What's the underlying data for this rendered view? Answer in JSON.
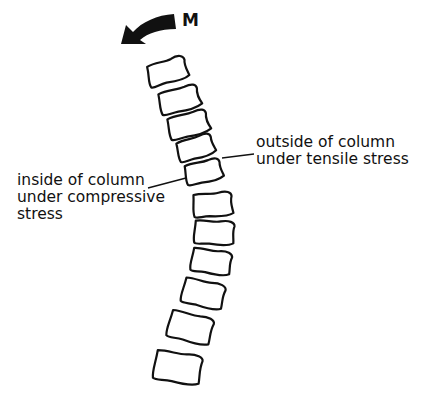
{
  "diagram": {
    "moment_label": "M",
    "labels": {
      "outside": [
        "outside of column",
        "under tensile stress"
      ],
      "inside": [
        "inside of column",
        "under compressive",
        "stress"
      ]
    },
    "vertebrae_count": 11,
    "colors": {
      "stroke": "#111111",
      "background": "#ffffff"
    }
  }
}
